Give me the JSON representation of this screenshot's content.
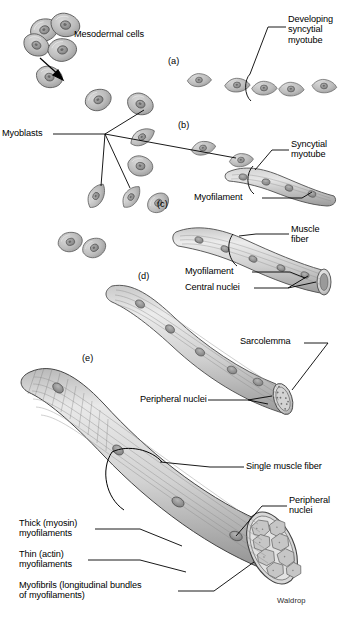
{
  "figure": {
    "credit": "Waldrop",
    "background_color": "#ffffff",
    "ink_color": "#000000",
    "cell_fill": "#b9b9b9",
    "cell_stroke": "#4a4a4a",
    "nucleus_fill": "#8a8a8a"
  },
  "panels": [
    {
      "key": "a",
      "label": "(a)",
      "x": 168,
      "y": 62
    },
    {
      "key": "b",
      "label": "(b)",
      "x": 178,
      "y": 126
    },
    {
      "key": "c",
      "label": "(c)",
      "x": 157,
      "y": 205
    },
    {
      "key": "d",
      "label": "(d)",
      "x": 138,
      "y": 277
    },
    {
      "key": "e",
      "label": "(e)",
      "x": 82,
      "y": 359
    }
  ],
  "labels": [
    {
      "id": "mesodermal-cells",
      "text": "Mesodermal cells",
      "x": 74,
      "y": 34,
      "align": "l"
    },
    {
      "id": "developing-syncytial-myotube",
      "text": "Developing\nsyncytial\nmyotube",
      "x": 288,
      "y": 20,
      "align": "l"
    },
    {
      "id": "myoblasts",
      "text": "Myoblasts",
      "x": 2,
      "y": 131,
      "align": "l"
    },
    {
      "id": "syncytial-myotube",
      "text": "Syncytial\nmyotube",
      "x": 291,
      "y": 144,
      "align": "l"
    },
    {
      "id": "myofilament-1",
      "text": "Myofilament",
      "x": 194,
      "y": 194,
      "align": "l"
    },
    {
      "id": "muscle-fiber",
      "text": "Muscle\nfiber",
      "x": 291,
      "y": 228,
      "align": "l"
    },
    {
      "id": "myofilament-2",
      "text": "Myofilament",
      "x": 185,
      "y": 268,
      "align": "l"
    },
    {
      "id": "central-nuclei",
      "text": "Central nuclei",
      "x": 185,
      "y": 284,
      "align": "l"
    },
    {
      "id": "sarcolemma",
      "text": "Sarcolemma",
      "x": 240,
      "y": 338,
      "align": "l"
    },
    {
      "id": "peripheral-nuclei-1",
      "text": "Peripheral nuclei",
      "x": 140,
      "y": 395,
      "align": "l"
    },
    {
      "id": "single-muscle-fiber",
      "text": "Single muscle fiber",
      "x": 246,
      "y": 462,
      "align": "l"
    },
    {
      "id": "peripheral-nuclei-2",
      "text": "Peripheral\nnuclei",
      "x": 289,
      "y": 500,
      "align": "l"
    },
    {
      "id": "thick-myosin-myofilaments",
      "text": "Thick (myosin)\nmyofilaments",
      "x": 19,
      "y": 524,
      "align": "l"
    },
    {
      "id": "thin-actin-myofilaments",
      "text": "Thin (actin)\nmyofilaments",
      "x": 19,
      "y": 555,
      "align": "l"
    },
    {
      "id": "myofibrils",
      "text": "Myofibrils (longitudinal bundles\nof myofilaments)",
      "x": 19,
      "y": 586,
      "align": "l"
    }
  ]
}
